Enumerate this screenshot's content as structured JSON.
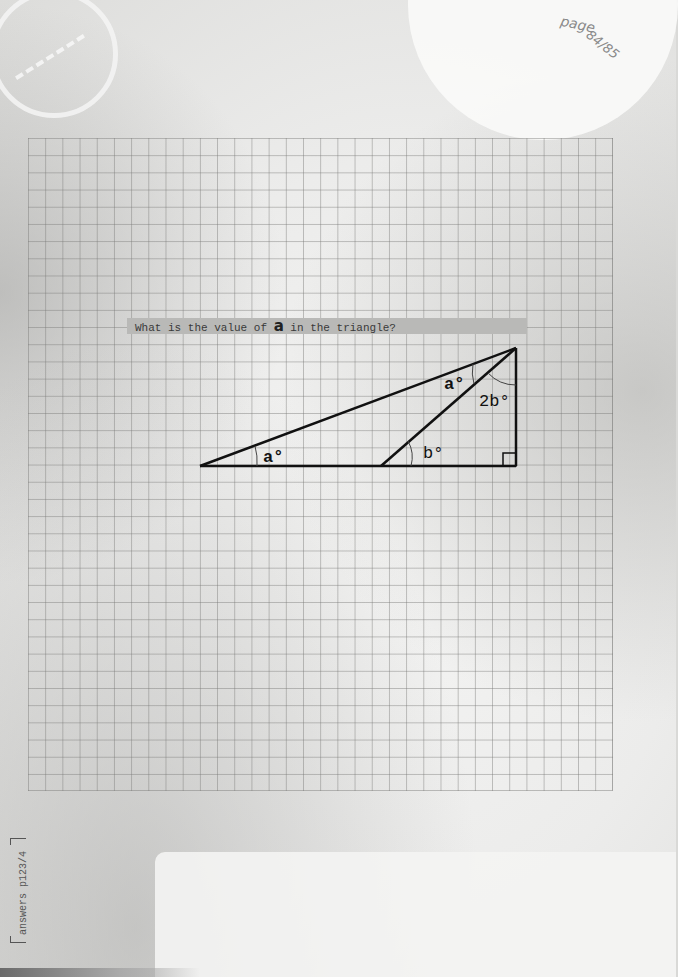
{
  "page": {
    "label": "page",
    "number": "84/85"
  },
  "question": {
    "prefix": "What is the value of ",
    "variable": "a",
    "suffix": " in the triangle?"
  },
  "diagram": {
    "labels": {
      "angle_left": "a°",
      "angle_top_inner": "a°",
      "angle_top_right": "2b°",
      "angle_mid": "b°"
    },
    "right_angle_marker": true
  },
  "footer": {
    "answers_ref": "answers p123/4"
  }
}
